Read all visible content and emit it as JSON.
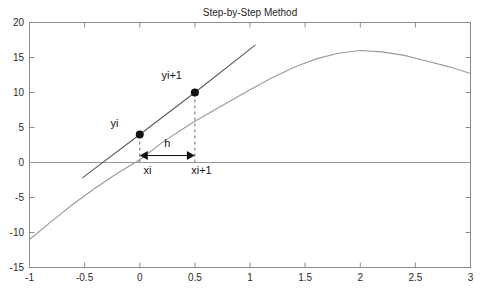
{
  "chart_data": {
    "type": "line",
    "title": "Step-by-Step Method",
    "xlabel": "",
    "ylabel": "",
    "xlim": [
      -1,
      3
    ],
    "ylim": [
      -15,
      20
    ],
    "grid": false,
    "legend": "none",
    "xticks": [
      "-1",
      "-0.5",
      "0",
      "0.5",
      "1",
      "1.5",
      "2",
      "2.5",
      "3"
    ],
    "xtick_values": [
      -1,
      -0.5,
      0,
      0.5,
      1,
      1.5,
      2,
      2.5,
      3
    ],
    "yticks": [
      "20",
      "15",
      "10",
      "5",
      "0",
      "-5",
      "-10",
      "-15"
    ],
    "ytick_values": [
      20,
      15,
      10,
      5,
      0,
      -5,
      -10,
      -15
    ],
    "series": [
      {
        "name": "solution-curve",
        "type": "line",
        "color": "#9a9a9a",
        "x": [
          -1,
          -0.8,
          -0.6,
          -0.4,
          -0.2,
          0,
          0.2,
          0.4,
          0.5,
          0.6,
          0.8,
          1,
          1.2,
          1.4,
          1.6,
          1.8,
          2,
          2.2,
          2.4,
          2.6,
          2.8,
          3
        ],
        "y": [
          -11,
          -8.4,
          -5.9,
          -3.6,
          -1.5,
          0.4,
          2.8,
          4.9,
          5.9,
          6.8,
          8.6,
          10.4,
          12.1,
          13.6,
          14.8,
          15.6,
          16,
          15.8,
          15.3,
          14.5,
          13.7,
          12.7
        ]
      },
      {
        "name": "tangent-line",
        "type": "line",
        "color": "#4a4a4a",
        "x": [
          -0.52,
          0,
          0.5,
          1.05
        ],
        "y": [
          -2.2,
          4,
          10,
          16.8
        ]
      },
      {
        "name": "zero-axis-line",
        "type": "line",
        "color": "#9a9a9a",
        "x": [
          -1,
          3
        ],
        "y": [
          0,
          0
        ]
      }
    ],
    "points": [
      {
        "label": "yi",
        "x": 0,
        "y": 4
      },
      {
        "label": "yi+1",
        "x": 0.5,
        "y": 10
      }
    ],
    "annotations": [
      {
        "name": "yi-label",
        "text": "yi",
        "x": -0.23,
        "y": 5.1
      },
      {
        "name": "yi-plus-1-label",
        "text": "yi+1",
        "x": 0.29,
        "y": 12.0
      },
      {
        "name": "h-label",
        "text": "h",
        "x": 0.25,
        "y": 2.2
      },
      {
        "name": "xi-label",
        "text": "xi",
        "x": 0.07,
        "y": -1.6
      },
      {
        "name": "xi-plus-1-label",
        "text": "xi+1",
        "x": 0.56,
        "y": -1.6
      }
    ],
    "guides": [
      {
        "name": "xi-dashed-vertical",
        "x": 0,
        "y0": 0,
        "y1": 4
      },
      {
        "name": "xi-plus-1-dashed-vertical",
        "x": 0.5,
        "y0": 0,
        "y1": 10
      },
      {
        "name": "step-width-arrow",
        "x0": 0,
        "x1": 0.5,
        "y": 1.0
      }
    ],
    "colors": {
      "curve": "#9a9a9a",
      "tangent": "#4a4a4a",
      "axis": "#8c8c8c",
      "marker": "#111111",
      "text": "#1f1f1f",
      "background": "#ffffff"
    }
  }
}
